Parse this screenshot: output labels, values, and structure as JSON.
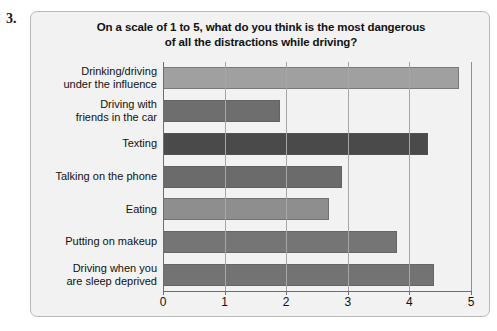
{
  "question_number": "3.",
  "chart_data": {
    "type": "bar",
    "orientation": "horizontal",
    "title": "On a scale of 1 to 5, what do you think is the most dangerous of all the distractions while driving?",
    "title_lines": [
      "On a scale of 1 to 5, what do you think is the most dangerous",
      "of all the distractions while driving?"
    ],
    "xlabel": "",
    "ylabel": "",
    "xlim": [
      0,
      5
    ],
    "x_ticks": [
      "0",
      "1",
      "2",
      "3",
      "4",
      "5"
    ],
    "grid": true,
    "legend": false,
    "categories": [
      "Drinking/driving under the influence",
      "Driving with friends in the car",
      "Texting",
      "Talking on the phone",
      "Eating",
      "Putting on makeup",
      "Driving when you are sleep deprived"
    ],
    "category_lines": [
      [
        "Drinking/driving",
        "under the influence"
      ],
      [
        "Driving with",
        "friends in the car"
      ],
      [
        "Texting"
      ],
      [
        "Talking on the phone"
      ],
      [
        "Eating"
      ],
      [
        "Putting on makeup"
      ],
      [
        "Driving when you",
        "are sleep deprived"
      ]
    ],
    "values": [
      4.8,
      1.9,
      4.3,
      2.9,
      2.7,
      3.8,
      4.4
    ],
    "bar_colors": [
      "#a0a0a0",
      "#6e6e6e",
      "#4a4a4a",
      "#6b6b6b",
      "#8e8e8e",
      "#757575",
      "#737373"
    ]
  }
}
